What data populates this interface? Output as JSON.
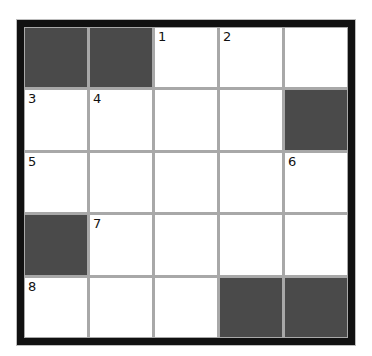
{
  "puzzle": {
    "rows": 5,
    "cols": 5,
    "colors": {
      "frame": "#111111",
      "gridline": "#a8a8a8",
      "block": "#4a4a4a",
      "open": "#ffffff"
    },
    "cells": [
      {
        "row": 0,
        "col": 0,
        "block": true,
        "number": ""
      },
      {
        "row": 0,
        "col": 1,
        "block": true,
        "number": ""
      },
      {
        "row": 0,
        "col": 2,
        "block": false,
        "number": "1"
      },
      {
        "row": 0,
        "col": 3,
        "block": false,
        "number": "2"
      },
      {
        "row": 0,
        "col": 4,
        "block": false,
        "number": ""
      },
      {
        "row": 1,
        "col": 0,
        "block": false,
        "number": "3"
      },
      {
        "row": 1,
        "col": 1,
        "block": false,
        "number": "4"
      },
      {
        "row": 1,
        "col": 2,
        "block": false,
        "number": ""
      },
      {
        "row": 1,
        "col": 3,
        "block": false,
        "number": ""
      },
      {
        "row": 1,
        "col": 4,
        "block": true,
        "number": ""
      },
      {
        "row": 2,
        "col": 0,
        "block": false,
        "number": "5"
      },
      {
        "row": 2,
        "col": 1,
        "block": false,
        "number": ""
      },
      {
        "row": 2,
        "col": 2,
        "block": false,
        "number": ""
      },
      {
        "row": 2,
        "col": 3,
        "block": false,
        "number": ""
      },
      {
        "row": 2,
        "col": 4,
        "block": false,
        "number": "6"
      },
      {
        "row": 3,
        "col": 0,
        "block": true,
        "number": ""
      },
      {
        "row": 3,
        "col": 1,
        "block": false,
        "number": "7"
      },
      {
        "row": 3,
        "col": 2,
        "block": false,
        "number": ""
      },
      {
        "row": 3,
        "col": 3,
        "block": false,
        "number": ""
      },
      {
        "row": 3,
        "col": 4,
        "block": false,
        "number": ""
      },
      {
        "row": 4,
        "col": 0,
        "block": false,
        "number": "8"
      },
      {
        "row": 4,
        "col": 1,
        "block": false,
        "number": ""
      },
      {
        "row": 4,
        "col": 2,
        "block": false,
        "number": ""
      },
      {
        "row": 4,
        "col": 3,
        "block": true,
        "number": ""
      },
      {
        "row": 4,
        "col": 4,
        "block": true,
        "number": ""
      }
    ]
  }
}
